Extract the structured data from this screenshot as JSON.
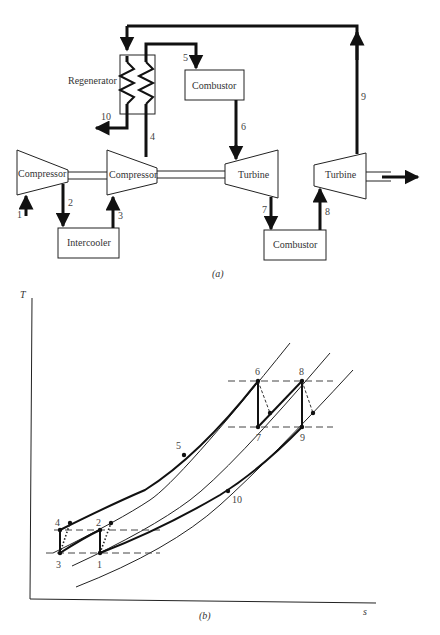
{
  "diagram_a": {
    "caption": "(a)",
    "components": {
      "regenerator": "Regenerator",
      "combustor_top": "Combustor",
      "compressor_1": "Compressor",
      "compressor_2": "Compressor",
      "turbine_1": "Turbine",
      "turbine_2": "Turbine",
      "intercooler": "Intercooler",
      "combustor_bottom": "Combustor"
    },
    "state_labels": {
      "s1": "1",
      "s2": "2",
      "s3": "3",
      "s4": "4",
      "s5": "5",
      "s6": "6",
      "s7": "7",
      "s8": "8",
      "s9": "9",
      "s10": "10"
    }
  },
  "diagram_b": {
    "caption": "(b)",
    "y_axis_label": "T",
    "x_axis_label": "s",
    "state_labels": {
      "p1": "1",
      "p2": "2",
      "p3": "3",
      "p4": "4",
      "p5": "5",
      "p6": "6",
      "p7": "7",
      "p8": "8",
      "p9": "9",
      "p10": "10"
    }
  }
}
